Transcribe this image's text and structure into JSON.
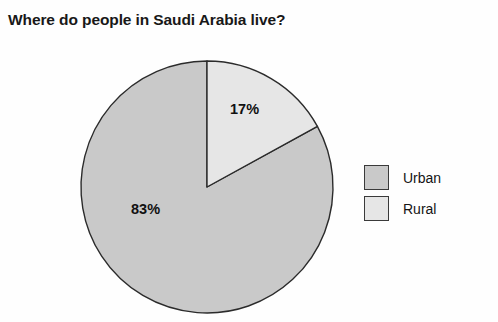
{
  "chart_data": {
    "type": "pie",
    "title": "Where do people in Saudi Arabia live?",
    "xlabel": "",
    "ylabel": "",
    "legend_position": "right",
    "grid": false,
    "start_angle_deg": 0,
    "direction": "clockwise",
    "categories": [
      "Urban",
      "Rural"
    ],
    "values": [
      83,
      17
    ],
    "value_labels": [
      "83%",
      "17%"
    ],
    "slices": [
      {
        "name": "Urban",
        "value": 83,
        "label": "83%",
        "color": "#c9c9c9",
        "start_deg": 61.2,
        "sweep_deg": 298.8
      },
      {
        "name": "Rural",
        "value": 17,
        "label": "17%",
        "color": "#e6e6e6",
        "start_deg": 0,
        "sweep_deg": 61.2
      }
    ],
    "colors": {
      "urban": "#c9c9c9",
      "rural": "#e6e6e6",
      "outline": "#2b2b2b",
      "background": "#fefefe",
      "title_text": "#181818",
      "label_text": "#111111"
    }
  },
  "legend": {
    "items": [
      {
        "label": "Urban",
        "color": "#c9c9c9"
      },
      {
        "label": "Rural",
        "color": "#e6e6e6"
      }
    ]
  }
}
